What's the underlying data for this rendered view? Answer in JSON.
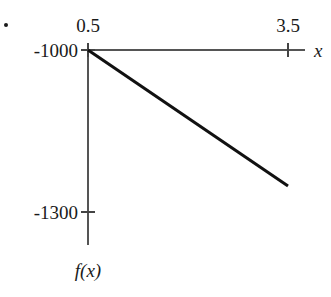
{
  "chart_data": {
    "type": "line",
    "title": "",
    "subtitle": "",
    "xlabel": "x",
    "ylabel": "f(x)",
    "xlim": [
      0.5,
      3.5
    ],
    "ylim": [
      -1300,
      -1000
    ],
    "xticks": [
      0.5,
      3.5
    ],
    "xtick_labels": [
      "0.5",
      "3.5"
    ],
    "yticks": [
      -1000,
      -1300
    ],
    "ytick_labels": [
      "-1000",
      "-1300"
    ],
    "grid": false,
    "legend": null,
    "series": [
      {
        "name": "f(x)",
        "color": "#111111",
        "linewidth": 3,
        "x": [
          0.5,
          3.5
        ],
        "y": [
          -1000,
          -1252
        ]
      }
    ],
    "annotations": [
      {
        "name": "bullet-marker",
        "text": "•"
      }
    ],
    "axis_color": "#555555",
    "text_color": "#1a1a1a"
  },
  "geometry": {
    "origin_px": {
      "x": 88,
      "y": 50
    },
    "x_end_px": 305,
    "y_end_px": 245,
    "xtick_px": [
      88,
      288
    ],
    "ytick_px": [
      50,
      212
    ],
    "line_px": {
      "x1": 88,
      "y1": 50,
      "x2": 289,
      "y2": 186
    }
  }
}
